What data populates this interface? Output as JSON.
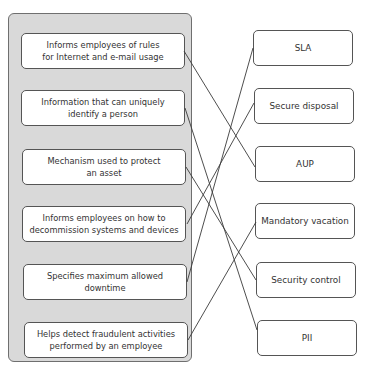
{
  "left_items": [
    {
      "line1": "Informs employees of rules",
      "line2": "for Internet and e-mail usage"
    },
    {
      "line1": "Information that can uniquely",
      "line2": "identify a person"
    },
    {
      "line1": "Mechanism used to protect",
      "line2": "an asset"
    },
    {
      "line1": "Informs employees on how to",
      "line2": "decommission systems and devices"
    },
    {
      "line1": "Specifies maximum allowed",
      "line2": "downtime"
    },
    {
      "line1": "Helps detect fraudulent activities",
      "line2": "performed by an employee"
    }
  ],
  "right_items": [
    {
      "label": "SLA"
    },
    {
      "label": "Secure disposal"
    },
    {
      "label": "AUP"
    },
    {
      "label": "Mandatory vacation"
    },
    {
      "label": "Security control"
    },
    {
      "label": "PII"
    }
  ],
  "connections": [
    {
      "from": "Informs employees of rules for Internet and e-mail usage",
      "to": "AUP"
    },
    {
      "from": "Information that can uniquely identify a person",
      "to": "PII"
    },
    {
      "from": "Mechanism used to protect an asset",
      "to": "Security control"
    },
    {
      "from": "Informs employees on how to decommission systems and devices",
      "to": "Secure disposal"
    },
    {
      "from": "Specifies maximum allowed downtime",
      "to": "SLA"
    },
    {
      "from": "Helps detect fraudulent activities performed by an employee",
      "to": "Mandatory vacation"
    }
  ],
  "colors": {
    "panel": "#d9d9d9",
    "box": "#ffffff",
    "border": "#555555",
    "line": "#3a3a3a"
  }
}
